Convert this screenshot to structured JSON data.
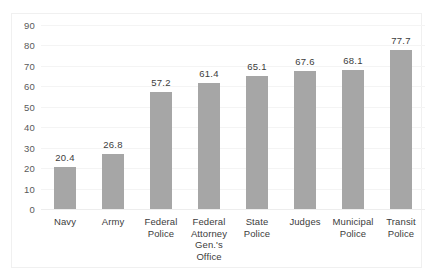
{
  "chart_data": {
    "type": "bar",
    "title": "",
    "subtitle": "",
    "xlabel": "",
    "ylabel": "",
    "ylim": [
      0,
      90
    ],
    "ytick_step": 10,
    "yticks": [
      "90",
      "80",
      "70",
      "60",
      "50",
      "40",
      "30",
      "20",
      "10",
      "0"
    ],
    "grid": true,
    "grid_axis": "y",
    "legend": false,
    "legend_position": "none",
    "bar_color": "#a6a6a6",
    "label_color": "#3c3c3c",
    "axis_text_color": "#5a5a5a",
    "gridline_color": "#f4f4f4",
    "frame_color": "#f0f0f0",
    "categories": [
      "Navy",
      "Army",
      "Federal Police",
      "Federal Attorney Gen.'s Office",
      "State Police",
      "Judges",
      "Municipal Police",
      "Transit Police"
    ],
    "category_lines": [
      [
        "Navy"
      ],
      [
        "Army"
      ],
      [
        "Federal",
        "Police"
      ],
      [
        "Federal",
        "Attorney",
        "Gen.'s",
        "Office"
      ],
      [
        "State",
        "Police"
      ],
      [
        "Judges"
      ],
      [
        "Municipal",
        "Police"
      ],
      [
        "Transit",
        "Police"
      ]
    ],
    "values": [
      20.4,
      26.8,
      57.2,
      61.4,
      65.1,
      67.6,
      68.1,
      77.7
    ],
    "value_labels": [
      "20.4",
      "26.8",
      "57.2",
      "61.4",
      "65.1",
      "67.6",
      "68.1",
      "77.7"
    ]
  }
}
